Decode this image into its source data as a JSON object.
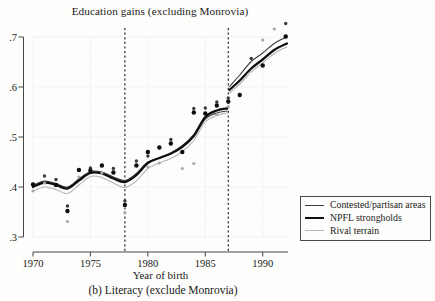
{
  "title": "Education gains (excluding Monrovia)",
  "caption": "(b) Literacy (exclude Monrovia)",
  "colors": {
    "contested_line": "#3d3d3d",
    "npfl_line": "#0f0f0f",
    "rival_line": "#b5b5b5",
    "gridline": "#e2e2e2",
    "cutoff_dash": "#1a1a1a",
    "axis": "#444444",
    "text": "#1a1a1a",
    "legend_border": "#4a4a4a",
    "background": "#fdfdfb"
  },
  "chart_data": {
    "type": "line",
    "title": "Education gains (excluding Monrovia)",
    "subtitle": "(b) Literacy (exclude Monrovia)",
    "xlabel": "Year of birth",
    "ylabel": "",
    "xlim": [
      1970,
      1992.2
    ],
    "ylim": [
      0.3,
      0.7
    ],
    "grid": true,
    "legend_position": "bottom-right",
    "xticks": {
      "values": [
        1970,
        1975,
        1980,
        1985,
        1990
      ],
      "labels": [
        "1970",
        "1975",
        "1980",
        "1985",
        "1990"
      ]
    },
    "yticks": {
      "values": [
        0.3,
        0.4,
        0.5,
        0.6,
        0.7
      ],
      "labels": [
        ".3",
        ".4",
        ".5",
        ".6",
        ".7"
      ]
    },
    "cutoff_lines": [
      1978,
      1987
    ],
    "series": [
      {
        "name": "Contested/partisan areas",
        "color": "#3d3d3d",
        "width": 1.1,
        "segments": [
          {
            "x": [
              1970,
              1971,
              1972,
              1973,
              1974,
              1975,
              1976,
              1977,
              1978,
              1979,
              1980,
              1981,
              1982,
              1983,
              1984,
              1985,
              1986,
              1986.9
            ],
            "y": [
              0.404,
              0.412,
              0.407,
              0.4,
              0.416,
              0.431,
              0.43,
              0.42,
              0.413,
              0.427,
              0.45,
              0.458,
              0.466,
              0.479,
              0.5,
              0.536,
              0.548,
              0.552
            ]
          },
          {
            "x": [
              1987.1,
              1988,
              1989,
              1990,
              1991,
              1992.1
            ],
            "y": [
              0.601,
              0.624,
              0.651,
              0.668,
              0.687,
              0.7
            ]
          }
        ]
      },
      {
        "name": "NPFL strongholds",
        "color": "#0f0f0f",
        "width": 2.3,
        "segments": [
          {
            "x": [
              1970,
              1971,
              1972,
              1973,
              1974,
              1975,
              1976,
              1977,
              1978,
              1979,
              1980,
              1981,
              1982,
              1983,
              1984,
              1985,
              1986,
              1986.9
            ],
            "y": [
              0.4,
              0.409,
              0.404,
              0.397,
              0.413,
              0.428,
              0.427,
              0.417,
              0.41,
              0.424,
              0.448,
              0.458,
              0.467,
              0.481,
              0.503,
              0.54,
              0.553,
              0.557
            ]
          },
          {
            "x": [
              1987.1,
              1988,
              1989,
              1990,
              1991,
              1992.1
            ],
            "y": [
              0.594,
              0.613,
              0.637,
              0.655,
              0.674,
              0.687
            ]
          }
        ]
      },
      {
        "name": "Rival terrain",
        "color": "#b5b5b5",
        "width": 1.1,
        "segments": [
          {
            "x": [
              1970,
              1971,
              1972,
              1973,
              1974,
              1975,
              1976,
              1977,
              1978,
              1979,
              1980,
              1981,
              1982,
              1983,
              1984,
              1985,
              1986,
              1986.9
            ],
            "y": [
              0.392,
              0.4,
              0.395,
              0.387,
              0.404,
              0.421,
              0.419,
              0.408,
              0.399,
              0.412,
              0.437,
              0.448,
              0.457,
              0.471,
              0.493,
              0.53,
              0.543,
              0.548
            ]
          },
          {
            "x": [
              1987.1,
              1988,
              1989,
              1990,
              1991,
              1992.1
            ],
            "y": [
              0.588,
              0.606,
              0.63,
              0.648,
              0.667,
              0.68
            ]
          }
        ]
      }
    ],
    "scatter": [
      {
        "name": "Contested/partisan areas",
        "color": "#3a3a3a",
        "r": 1.7,
        "points": [
          [
            1971,
            0.422
          ],
          [
            1972,
            0.415
          ],
          [
            1973,
            0.362
          ],
          [
            1975,
            0.438
          ],
          [
            1977,
            0.437
          ],
          [
            1978,
            0.372
          ],
          [
            1979,
            0.452
          ],
          [
            1980,
            0.462
          ],
          [
            1982,
            0.495
          ],
          [
            1984,
            0.557
          ],
          [
            1985,
            0.558
          ],
          [
            1986,
            0.57
          ],
          [
            1987,
            0.578
          ],
          [
            1989,
            0.657
          ],
          [
            1992,
            0.727
          ]
        ]
      },
      {
        "name": "NPFL strongholds",
        "color": "#0d0d0d",
        "r": 2.2,
        "points": [
          [
            1970,
            0.405
          ],
          [
            1972,
            0.404
          ],
          [
            1973,
            0.352
          ],
          [
            1974,
            0.434
          ],
          [
            1975,
            0.433
          ],
          [
            1976,
            0.443
          ],
          [
            1977,
            0.429
          ],
          [
            1978,
            0.364
          ],
          [
            1979,
            0.443
          ],
          [
            1980,
            0.47
          ],
          [
            1981,
            0.479
          ],
          [
            1982,
            0.487
          ],
          [
            1983,
            0.47
          ],
          [
            1984,
            0.549
          ],
          [
            1985,
            0.547
          ],
          [
            1986,
            0.563
          ],
          [
            1987,
            0.571
          ],
          [
            1988,
            0.584
          ],
          [
            1990,
            0.643
          ],
          [
            1992,
            0.701
          ]
        ]
      },
      {
        "name": "Rival terrain",
        "color": "#a8a8a8",
        "r": 1.6,
        "points": [
          [
            1970,
            0.392
          ],
          [
            1971,
            0.408
          ],
          [
            1973,
            0.331
          ],
          [
            1974,
            0.42
          ],
          [
            1976,
            0.428
          ],
          [
            1978,
            0.349
          ],
          [
            1980,
            0.44
          ],
          [
            1981,
            0.448
          ],
          [
            1983,
            0.437
          ],
          [
            1984,
            0.447
          ],
          [
            1986,
            0.545
          ],
          [
            1987,
            0.561
          ],
          [
            1990,
            0.694
          ],
          [
            1991,
            0.716
          ]
        ]
      }
    ]
  }
}
